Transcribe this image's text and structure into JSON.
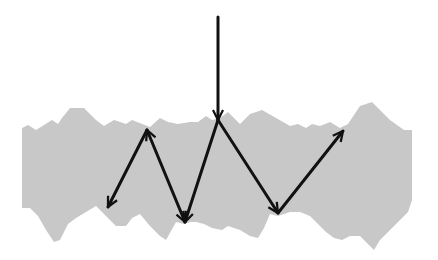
{
  "diagram": {
    "type": "light-scattering-in-rough-layer",
    "colors": {
      "background": "#ffffff",
      "medium": "#c8c8c8",
      "arrow": "#111111"
    },
    "medium": {
      "shape": "jagged-band",
      "top_edge": [
        [
          22,
          128
        ],
        [
          28,
          125
        ],
        [
          36,
          130
        ],
        [
          44,
          125
        ],
        [
          52,
          120
        ],
        [
          58,
          124
        ],
        [
          62,
          118
        ],
        [
          70,
          108
        ],
        [
          84,
          108
        ],
        [
          96,
          120
        ],
        [
          104,
          126
        ],
        [
          114,
          120
        ],
        [
          126,
          124
        ],
        [
          132,
          120
        ],
        [
          150,
          127
        ],
        [
          160,
          118
        ],
        [
          168,
          122
        ],
        [
          178,
          124
        ],
        [
          190,
          122
        ],
        [
          198,
          122
        ],
        [
          206,
          116
        ],
        [
          212,
          120
        ],
        [
          220,
          118
        ],
        [
          228,
          112
        ],
        [
          234,
          118
        ],
        [
          240,
          124
        ],
        [
          250,
          114
        ],
        [
          262,
          110
        ],
        [
          276,
          118
        ],
        [
          290,
          126
        ],
        [
          298,
          124
        ],
        [
          306,
          128
        ],
        [
          312,
          124
        ],
        [
          320,
          126
        ],
        [
          330,
          122
        ],
        [
          340,
          128
        ],
        [
          348,
          124
        ],
        [
          360,
          106
        ],
        [
          372,
          102
        ],
        [
          390,
          120
        ],
        [
          404,
          130
        ],
        [
          412,
          130
        ]
      ],
      "bottom_edge": [
        [
          412,
          200
        ],
        [
          408,
          212
        ],
        [
          400,
          220
        ],
        [
          390,
          230
        ],
        [
          380,
          240
        ],
        [
          374,
          250
        ],
        [
          368,
          244
        ],
        [
          360,
          236
        ],
        [
          350,
          236
        ],
        [
          342,
          240
        ],
        [
          334,
          238
        ],
        [
          326,
          232
        ],
        [
          318,
          224
        ],
        [
          310,
          216
        ],
        [
          300,
          212
        ],
        [
          290,
          212
        ],
        [
          278,
          216
        ],
        [
          270,
          214
        ],
        [
          264,
          228
        ],
        [
          258,
          238
        ],
        [
          250,
          236
        ],
        [
          240,
          230
        ],
        [
          228,
          226
        ],
        [
          222,
          230
        ],
        [
          212,
          228
        ],
        [
          204,
          224
        ],
        [
          196,
          222
        ],
        [
          190,
          222
        ],
        [
          184,
          224
        ],
        [
          176,
          222
        ],
        [
          166,
          240
        ],
        [
          160,
          236
        ],
        [
          150,
          226
        ],
        [
          140,
          214
        ],
        [
          132,
          218
        ],
        [
          126,
          226
        ],
        [
          116,
          226
        ],
        [
          104,
          214
        ],
        [
          96,
          206
        ],
        [
          86,
          212
        ],
        [
          76,
          218
        ],
        [
          68,
          224
        ],
        [
          60,
          240
        ],
        [
          54,
          242
        ],
        [
          46,
          230
        ],
        [
          38,
          216
        ],
        [
          30,
          208
        ],
        [
          22,
          208
        ]
      ]
    },
    "arrows": [
      {
        "id": "incident",
        "from": [
          218,
          17
        ],
        "to": [
          218,
          120
        ],
        "heads": "end"
      },
      {
        "id": "scatter-1",
        "from": [
          218,
          120
        ],
        "to": [
          185,
          222
        ],
        "heads": "end"
      },
      {
        "id": "scatter-2",
        "from": [
          185,
          222
        ],
        "to": [
          147,
          130
        ],
        "heads": "both"
      },
      {
        "id": "scatter-3",
        "from": [
          147,
          130
        ],
        "to": [
          108,
          207
        ],
        "heads": "end"
      },
      {
        "id": "scatter-4",
        "from": [
          218,
          120
        ],
        "to": [
          278,
          213
        ],
        "heads": "end"
      },
      {
        "id": "scatter-5",
        "from": [
          278,
          213
        ],
        "to": [
          343,
          131
        ],
        "heads": "end"
      }
    ]
  }
}
